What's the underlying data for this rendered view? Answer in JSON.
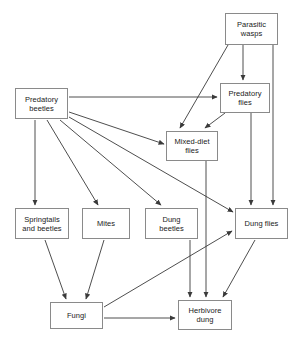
{
  "diagram": {
    "type": "food-web-flow-diagram",
    "title": "",
    "background_color": "#ffffff",
    "box_border_color": "#8a8a8a",
    "edge_color": "#3a3a3a",
    "text_color": "#1a1a1a",
    "nodes": [
      {
        "id": "parasitic_wasps",
        "label": "Parasitic\nwasps",
        "x": 225,
        "y": 13,
        "w": 53,
        "h": 32
      },
      {
        "id": "predatory_beetles",
        "label": "Predatory\nbeetles",
        "x": 15,
        "y": 88,
        "w": 53,
        "h": 31
      },
      {
        "id": "predatory_flies",
        "label": "Predatory\nflies",
        "x": 220,
        "y": 83,
        "w": 50,
        "h": 30
      },
      {
        "id": "mixed_diet_flies",
        "label": "Mixed-diet\nflies",
        "x": 166,
        "y": 131,
        "w": 52,
        "h": 30
      },
      {
        "id": "springtails",
        "label": "Springtails\nand beetles",
        "x": 15,
        "y": 208,
        "w": 54,
        "h": 31
      },
      {
        "id": "mites",
        "label": "Mites",
        "x": 82,
        "y": 208,
        "w": 48,
        "h": 31
      },
      {
        "id": "dung_beetles",
        "label": "Dung\nbeetles",
        "x": 145,
        "y": 208,
        "w": 53,
        "h": 31
      },
      {
        "id": "dung_flies",
        "label": "Dung flies",
        "x": 235,
        "y": 208,
        "w": 53,
        "h": 31
      },
      {
        "id": "fungi",
        "label": "Fungi",
        "x": 50,
        "y": 302,
        "w": 53,
        "h": 27
      },
      {
        "id": "herbivore_dung",
        "label": "Herbivore\ndung",
        "x": 178,
        "y": 300,
        "w": 54,
        "h": 30
      }
    ],
    "edges": [
      {
        "from": "parasitic_wasps",
        "to": "mixed_diet_flies",
        "x1": 228,
        "y1": 45,
        "x2": 180,
        "y2": 128
      },
      {
        "from": "parasitic_wasps",
        "to": "predatory_flies",
        "x1": 243,
        "y1": 45,
        "x2": 243,
        "y2": 80
      },
      {
        "from": "parasitic_wasps",
        "to": "dung_flies",
        "x1": 273,
        "y1": 45,
        "x2": 273,
        "y2": 205
      },
      {
        "from": "predatory_flies",
        "to": "mixed_diet_flies",
        "x1": 225,
        "y1": 113,
        "x2": 205,
        "y2": 128
      },
      {
        "from": "predatory_flies",
        "to": "dung_flies",
        "x1": 251,
        "y1": 113,
        "x2": 251,
        "y2": 205
      },
      {
        "from": "predatory_beetles",
        "to": "predatory_flies",
        "x1": 69,
        "y1": 97,
        "x2": 217,
        "y2": 97
      },
      {
        "from": "predatory_beetles",
        "to": "mixed_diet_flies",
        "x1": 69,
        "y1": 112,
        "x2": 164,
        "y2": 144
      },
      {
        "from": "predatory_beetles",
        "to": "dung_flies",
        "x1": 69,
        "y1": 117,
        "x2": 233,
        "y2": 212
      },
      {
        "from": "predatory_beetles",
        "to": "dung_beetles",
        "x1": 60,
        "y1": 120,
        "x2": 161,
        "y2": 205
      },
      {
        "from": "predatory_beetles",
        "to": "mites",
        "x1": 47,
        "y1": 120,
        "x2": 98,
        "y2": 205
      },
      {
        "from": "predatory_beetles",
        "to": "springtails",
        "x1": 35,
        "y1": 120,
        "x2": 35,
        "y2": 205
      },
      {
        "from": "mixed_diet_flies",
        "to": "herbivore_dung",
        "x1": 206,
        "y1": 161,
        "x2": 206,
        "y2": 297
      },
      {
        "from": "dung_beetles",
        "to": "herbivore_dung",
        "x1": 190,
        "y1": 240,
        "x2": 190,
        "y2": 297
      },
      {
        "from": "dung_flies",
        "to": "herbivore_dung",
        "x1": 255,
        "y1": 240,
        "x2": 223,
        "y2": 297
      },
      {
        "from": "springtails",
        "to": "fungi",
        "x1": 45,
        "y1": 240,
        "x2": 66,
        "y2": 299
      },
      {
        "from": "mites",
        "to": "fungi",
        "x1": 104,
        "y1": 240,
        "x2": 86,
        "y2": 299
      },
      {
        "from": "fungi",
        "to": "dung_flies",
        "x1": 104,
        "y1": 307,
        "x2": 232,
        "y2": 231
      },
      {
        "from": "fungi",
        "to": "herbivore_dung",
        "x1": 104,
        "y1": 318,
        "x2": 175,
        "y2": 318
      }
    ]
  }
}
